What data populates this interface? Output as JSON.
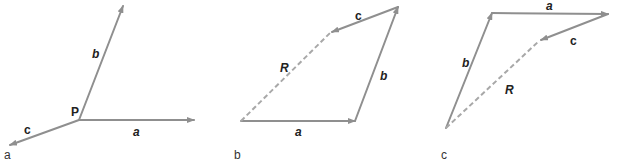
{
  "figure": {
    "panels": [
      {
        "id": "a",
        "panel_label": "a",
        "point_label": "P",
        "vectors": [
          {
            "name": "a",
            "label": "a"
          },
          {
            "name": "b",
            "label": "b"
          },
          {
            "name": "c",
            "label": "c"
          }
        ]
      },
      {
        "id": "b",
        "panel_label": "b",
        "vectors": [
          {
            "name": "a",
            "label": "a"
          },
          {
            "name": "b",
            "label": "b"
          },
          {
            "name": "c",
            "label": "c"
          },
          {
            "name": "R",
            "label": "R",
            "style": "dashed"
          }
        ]
      },
      {
        "id": "c",
        "panel_label": "c",
        "vectors": [
          {
            "name": "b",
            "label": "b"
          },
          {
            "name": "a",
            "label": "a"
          },
          {
            "name": "c",
            "label": "c"
          },
          {
            "name": "R",
            "label": "R",
            "style": "dashed"
          }
        ]
      }
    ],
    "colors": {
      "vector": "#8f8f8f",
      "resultant": "#a8a8a8",
      "text": "#222222"
    }
  }
}
